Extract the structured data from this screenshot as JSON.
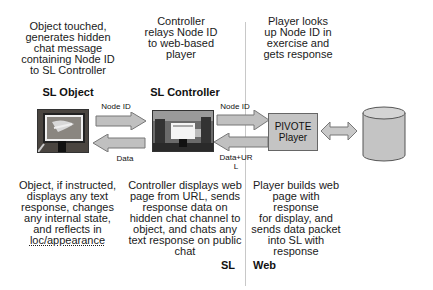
{
  "columns": {
    "sl_object": {
      "top_text": [
        "Object touched,",
        "generates hidden",
        "chat message",
        "containing Node ID",
        "to SL Controller"
      ],
      "title": "SL Object",
      "bottom_text": [
        "Object, if instructed,",
        "displays any text",
        "response, changes",
        "any internal state,",
        "and reflects in",
        "loc/appearance"
      ]
    },
    "sl_controller": {
      "top_text": [
        "Controller",
        "relays Node ID",
        "to web-based",
        "player"
      ],
      "title": "SL Controller",
      "bottom_text": [
        "Controller displays web",
        "page from URL, sends",
        "response data on",
        "hidden chat channel to",
        "object, and chats any",
        "text response on public",
        "chat"
      ]
    },
    "player": {
      "top_text": [
        "Player looks",
        "up Node ID in",
        "exercise and",
        "gets response"
      ],
      "box_label": [
        "PIVOTE",
        "Player"
      ],
      "bottom_text": [
        "Player builds web",
        "page with response",
        "for display, and",
        "sends data packet",
        "into SL with",
        "response"
      ]
    },
    "database": {
      "label": [
        "PIVOTE",
        "Exercise",
        "Definition"
      ]
    }
  },
  "arrows": {
    "obj_to_ctrl": "Node ID",
    "ctrl_to_obj": "Data",
    "ctrl_to_player": "Node ID",
    "player_to_ctrl": [
      "Data+UR",
      "L"
    ]
  },
  "regions": {
    "left": "SL",
    "right": "Web"
  },
  "colors": {
    "arrow_fill": "#c0c0c0",
    "arrow_stroke": "#777777",
    "box_fill": "#c4c4c4",
    "divider": "#c8c8c8"
  }
}
